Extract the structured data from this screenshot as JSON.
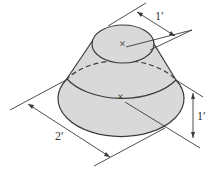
{
  "figure": {
    "type": "frustum of a cone (truncated cone), isometric view",
    "colors": {
      "fill": "#d9d9d9",
      "stroke": "#3a3a3a",
      "background": "#ffffff"
    },
    "dimensions": {
      "top_diameter": "1′",
      "bottom_diameter": "2′",
      "height": "1′"
    },
    "markers": {
      "top_center": "×",
      "bottom_center": "×"
    }
  }
}
